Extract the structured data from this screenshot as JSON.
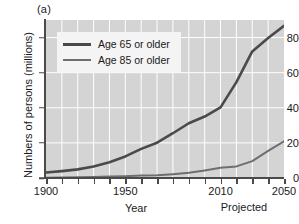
{
  "figure": {
    "panel_label": "(a)",
    "accent_dark": "#4a4a4a",
    "accent_mid": "#6e6e6e",
    "plot_background": "#d4d4d4",
    "grid_color": "#ffffff"
  },
  "axes": {
    "ylabel": "Numbers of persons (millions)",
    "xlabel": "Year",
    "yticks": [
      "0",
      "20",
      "40",
      "60",
      "80"
    ],
    "xticks": [
      "1900",
      "1950",
      "2010",
      "2050"
    ]
  },
  "annotations": {
    "projected": "Projected"
  },
  "legend": {
    "items": [
      {
        "label": "Age 65 or older"
      },
      {
        "label": "Age 85 or older"
      }
    ]
  },
  "chart_data": {
    "type": "line",
    "title": "",
    "xlabel": "Year",
    "ylabel": "Numbers of persons (millions)",
    "xlim": [
      1900,
      2050
    ],
    "ylim": [
      0,
      90
    ],
    "yticks": [
      0,
      20,
      40,
      60,
      80
    ],
    "xticks": [
      1900,
      1950,
      2010,
      2050
    ],
    "grid": true,
    "legend_position": "upper-left",
    "annotations": [
      {
        "text": "(a)",
        "position": "outside-top-left"
      },
      {
        "text": "Projected",
        "x_range": [
          2010,
          2050
        ],
        "position": "below-axis"
      }
    ],
    "series": [
      {
        "name": "Age 65 or older",
        "color": "#4a4a4a",
        "x": [
          1900,
          1910,
          1920,
          1930,
          1940,
          1950,
          1960,
          1970,
          1980,
          1990,
          2000,
          2010,
          2020,
          2030,
          2040,
          2050
        ],
        "values": [
          3.1,
          3.9,
          4.9,
          6.6,
          9.0,
          12.3,
          16.6,
          20.1,
          25.5,
          31.2,
          35.0,
          40.2,
          54.6,
          72.1,
          79.7,
          86.7
        ]
      },
      {
        "name": "Age 85 or older",
        "color": "#6e6e6e",
        "x": [
          1900,
          1910,
          1920,
          1930,
          1940,
          1950,
          1960,
          1970,
          1980,
          1990,
          2000,
          2010,
          2020,
          2030,
          2040,
          2050
        ],
        "values": [
          0.2,
          0.3,
          0.4,
          0.5,
          0.8,
          1.0,
          1.4,
          1.5,
          2.2,
          3.0,
          4.3,
          5.8,
          6.6,
          9.6,
          15.4,
          20.9
        ]
      }
    ]
  }
}
